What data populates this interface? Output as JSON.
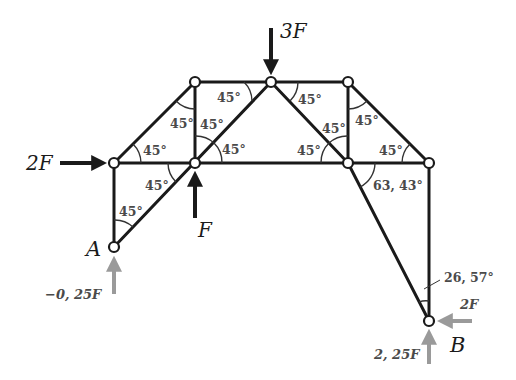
{
  "diagram": {
    "type": "truss-free-body-diagram",
    "supports": [
      {
        "id": "A",
        "label": "A"
      },
      {
        "id": "B",
        "label": "B"
      }
    ],
    "applied_loads": [
      {
        "id": "load-top",
        "label": "3F",
        "direction": "down"
      },
      {
        "id": "load-left",
        "label": "2F",
        "direction": "right"
      },
      {
        "id": "load-center",
        "label": "F",
        "direction": "up"
      }
    ],
    "reactions": [
      {
        "id": "reaction-a-vertical",
        "label": "−0, 25F",
        "direction": "up"
      },
      {
        "id": "reaction-b-vertical",
        "label": "2, 25F",
        "direction": "up"
      },
      {
        "id": "reaction-b-horizontal",
        "label": "2F",
        "direction": "left"
      }
    ],
    "angles": [
      {
        "id": "angle-1",
        "label": "45°"
      },
      {
        "id": "angle-2",
        "label": "45°"
      },
      {
        "id": "angle-3",
        "label": "45°"
      },
      {
        "id": "angle-4",
        "label": "45°"
      },
      {
        "id": "angle-5",
        "label": "45°"
      },
      {
        "id": "angle-6",
        "label": "45°"
      },
      {
        "id": "angle-7",
        "label": "45°"
      },
      {
        "id": "angle-8",
        "label": "45°"
      },
      {
        "id": "angle-9",
        "label": "45°"
      },
      {
        "id": "angle-10",
        "label": "45°"
      },
      {
        "id": "angle-11",
        "label": "45°"
      },
      {
        "id": "angle-12",
        "label": "45°"
      },
      {
        "id": "angle-13",
        "label": "45°"
      },
      {
        "id": "angle-14",
        "label": "63, 43°"
      },
      {
        "id": "angle-15",
        "label": "26, 57°"
      }
    ],
    "colors": {
      "member": "#1a1a1a",
      "reaction_arrow": "#9a9a9a",
      "angle_text": "#4a4a4a"
    }
  }
}
